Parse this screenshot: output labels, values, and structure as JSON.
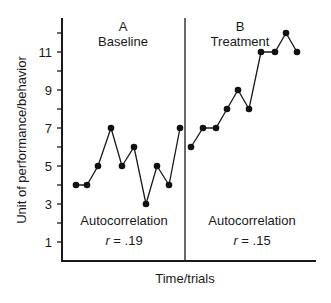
{
  "chart_data": {
    "type": "line",
    "title": "",
    "xlabel": "Time/trials",
    "ylabel": "Unit of performance/behavior",
    "ylim": [
      0,
      12.5
    ],
    "yticks_labeled": [
      1,
      3,
      5,
      7,
      9,
      11
    ],
    "yticks_minor": [
      2,
      4,
      6,
      8,
      10,
      12
    ],
    "grid": false,
    "legend": null,
    "phases": [
      {
        "letter": "A",
        "name": "Baseline",
        "annotation": "Autocorrelation",
        "r_label": "r = .19",
        "values": [
          4,
          4,
          5,
          7,
          5,
          6,
          3,
          5,
          4,
          7
        ]
      },
      {
        "letter": "B",
        "name": "Treatment",
        "annotation": "Autocorrelation",
        "r_label": "r = .15",
        "values": [
          6,
          7,
          7,
          8,
          9,
          8,
          11,
          11,
          12,
          11
        ]
      }
    ],
    "series": [
      {
        "name": "Baseline",
        "x": [
          1,
          2,
          3,
          4,
          5,
          6,
          7,
          8,
          9,
          10
        ],
        "values": [
          4,
          4,
          5,
          7,
          5,
          6,
          3,
          5,
          4,
          7
        ]
      },
      {
        "name": "Treatment",
        "x": [
          11,
          12,
          13,
          14,
          15,
          16,
          17,
          18,
          19,
          20
        ],
        "values": [
          6,
          7,
          7,
          8,
          9,
          8,
          11,
          11,
          12,
          11
        ]
      }
    ]
  },
  "labels": {
    "phase_a_letter": "A",
    "phase_a_name": "Baseline",
    "phase_b_letter": "B",
    "phase_b_name": "Treatment",
    "autocorr_a": "Autocorrelation",
    "r_a_var": "r",
    "r_a_val": " = .19",
    "autocorr_b": "Autocorrelation",
    "r_b_var": "r",
    "r_b_val": " = .15",
    "xlabel": "Time/trials",
    "ylabel": "Unit of performance/behavior",
    "ytick_1": "1",
    "ytick_3": "3",
    "ytick_5": "5",
    "ytick_7": "7",
    "ytick_9": "9",
    "ytick_11": "11"
  }
}
